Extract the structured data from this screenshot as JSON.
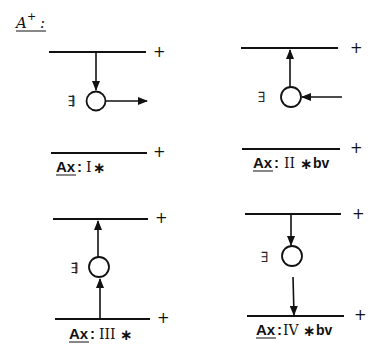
{
  "title": {
    "letter": "A",
    "superscript": "+",
    "colon": ":"
  },
  "panels": [
    {
      "id": "I",
      "ax_label": "Ax",
      "colon": ":",
      "roman": "I",
      "star": "∗",
      "suffix": "",
      "node_symbol": "∃",
      "node_symbol_variant": "double-barred mirrored E",
      "top_plus": "+",
      "bottom_plus": "+",
      "arrows": [
        "top-line → node (down)",
        "node → right (outgoing)"
      ]
    },
    {
      "id": "II",
      "ax_label": "Ax",
      "colon": ":",
      "roman": "II",
      "star": "∗",
      "suffix": "bv",
      "node_symbol": "∃",
      "node_symbol_variant": "mirrored E",
      "top_plus": "+",
      "bottom_plus": "+",
      "arrows": [
        "node → top-line (up)",
        "right → node (incoming)"
      ]
    },
    {
      "id": "III",
      "ax_label": "Ax",
      "colon": ":",
      "roman": "III",
      "star": "∗",
      "suffix": "",
      "node_symbol": "∃",
      "node_symbol_variant": "double-barred mirrored E",
      "top_plus": "+",
      "bottom_plus": "+",
      "arrows": [
        "node → top-line (up)",
        "bottom-line → node (up)"
      ]
    },
    {
      "id": "IV",
      "ax_label": "Ax",
      "colon": ":",
      "roman": "IV",
      "star": "∗",
      "suffix": "bv",
      "node_symbol": "∃",
      "node_symbol_variant": "mirrored E",
      "top_plus": "+",
      "bottom_plus": "+",
      "arrows": [
        "top-line → node (down)",
        "node → bottom-line (down)"
      ]
    }
  ]
}
